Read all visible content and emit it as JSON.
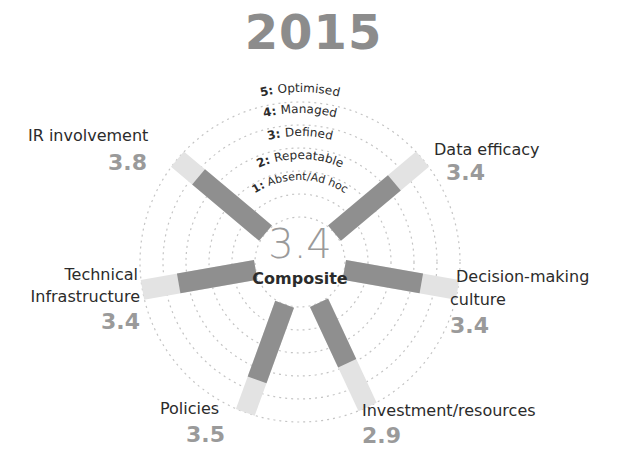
{
  "title": "2015",
  "center": {
    "value": "3.4",
    "label": "Composite"
  },
  "scale_levels": [
    {
      "num": "1:",
      "label": "Absent/Ad hoc"
    },
    {
      "num": "2:",
      "label": "Repeatable"
    },
    {
      "num": "3:",
      "label": "Defined"
    },
    {
      "num": "4:",
      "label": "Managed"
    },
    {
      "num": "5:",
      "label": "Optimised"
    }
  ],
  "categories": [
    {
      "label": "Data efficacy",
      "value": "3.4"
    },
    {
      "label": "Decision-making culture",
      "label_line1": "Decision-making",
      "label_line2": "culture",
      "value": "3.4"
    },
    {
      "label": "Investment/resources",
      "value": "2.9"
    },
    {
      "label": "Policies",
      "value": "3.5"
    },
    {
      "label": "Technical Infrastructure",
      "label_line1": "Technical",
      "label_line2": "Infrastructure",
      "value": "3.4"
    },
    {
      "label": "IR involvement",
      "value": "3.8"
    }
  ],
  "colors": {
    "bar_fill": "#8f8f8f",
    "bar_track": "#e3e3e3",
    "ring": "#c4c4c4",
    "title": "#8c8c8c",
    "value_text": "#9a9a9a",
    "label_text": "#2b2b2b"
  },
  "chart_data": {
    "type": "radial-bar",
    "title": "2015",
    "categories": [
      "Data efficacy",
      "Decision-making culture",
      "Investment/resources",
      "Policies",
      "Technical Infrastructure",
      "IR involvement"
    ],
    "values": [
      3.4,
      3.4,
      2.9,
      3.5,
      3.4,
      3.8
    ],
    "composite": 3.4,
    "scale": {
      "min": 1,
      "max": 5,
      "levels": [
        "1: Absent/Ad hoc",
        "2: Repeatable",
        "3: Defined",
        "4: Managed",
        "5: Optimised"
      ]
    },
    "grid": "dotted concentric circles",
    "legend": "none"
  }
}
